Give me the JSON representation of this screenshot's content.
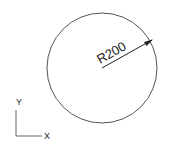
{
  "drawing": {
    "circle": {
      "cx": 102,
      "cy": 68,
      "r": 55,
      "stroke": "#555555"
    },
    "dimension": {
      "label": "R200",
      "from": [
        102,
        68
      ],
      "to": [
        152,
        40
      ],
      "text_x": 100,
      "text_y": 64,
      "angle": -29
    }
  },
  "ucs_icon": {
    "x_label": "X",
    "y_label": "Y"
  }
}
